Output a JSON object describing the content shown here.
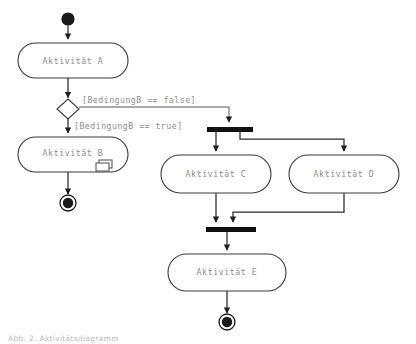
{
  "diagram": {
    "caption": "Abb. 2: Aktivitätsdiagramm",
    "colors": {
      "background": "#ffffff",
      "node_stroke": "#3a3a3a",
      "node_fill": "#ffffff",
      "label_text": "#8d8d8d",
      "flow_line": "#2b2b2b",
      "bar_fill": "#111111",
      "node_marker": "#1a1a1a"
    },
    "nodes": {
      "initial_start": {
        "type": "initial-node",
        "label": ""
      },
      "activity_a": {
        "type": "activity",
        "label": "Aktivität A"
      },
      "decision_b": {
        "type": "decision-node",
        "label": ""
      },
      "activity_b": {
        "type": "activity",
        "label": "Aktivität B",
        "icon": "sub-activity-icon"
      },
      "final_b": {
        "type": "final-node",
        "label": ""
      },
      "fork_bar": {
        "type": "fork-node",
        "label": ""
      },
      "activity_c": {
        "type": "activity",
        "label": "Aktivität C"
      },
      "activity_d": {
        "type": "activity",
        "label": "Aktivität D"
      },
      "join_bar": {
        "type": "join-node",
        "label": ""
      },
      "activity_e": {
        "type": "activity",
        "label": "Aktivität E"
      },
      "final_e": {
        "type": "final-node",
        "label": ""
      }
    },
    "guards": {
      "false_branch": "[BedingungB == false]",
      "true_branch": "[BedingungB == true]"
    }
  }
}
